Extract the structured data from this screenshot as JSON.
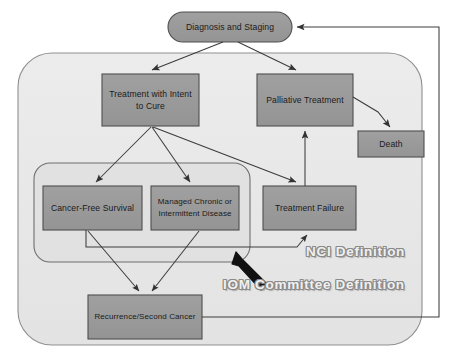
{
  "diagram": {
    "background_color": "#ffffff",
    "node_fill": "#999999",
    "node_stroke": "#555555",
    "container_fill": "#e8e8e8",
    "container_stroke": "#8a8a8a",
    "edge_color": "#404040",
    "text_color": "#1a1a1a"
  },
  "containers": [
    {
      "id": "nci-container",
      "name": "NCI Definition boundary",
      "label": "NCI Definition",
      "shape": "rounded-rectangle",
      "x": 18,
      "y": 53,
      "width": 404,
      "height": 292,
      "radius": 34
    },
    {
      "id": "iom-container",
      "name": "IOM Committee Definition boundary",
      "label": "IOM Committee Definition",
      "shape": "rounded-rectangle",
      "x": 34,
      "y": 163,
      "width": 216,
      "height": 99,
      "radius": 16
    }
  ],
  "nodes": [
    {
      "id": "diagnosis",
      "label": "Diagnosis and Staging",
      "shape": "stadium",
      "x": 168,
      "y": 12,
      "width": 124,
      "height": 30
    },
    {
      "id": "treatment-intent-cure",
      "label": "Treatment with Intent to Cure",
      "label_lines": [
        "Treatment with Intent",
        "to Cure"
      ],
      "shape": "rectangle",
      "x": 102,
      "y": 74,
      "width": 97,
      "height": 52
    },
    {
      "id": "palliative-treatment",
      "label": "Palliative Treatment",
      "label_lines": [
        "Palliative Treatment"
      ],
      "shape": "rectangle",
      "x": 257,
      "y": 74,
      "width": 96,
      "height": 52
    },
    {
      "id": "death",
      "label": "Death",
      "label_lines": [
        "Death"
      ],
      "shape": "rectangle",
      "x": 358,
      "y": 131,
      "width": 66,
      "height": 26
    },
    {
      "id": "cancer-free-survival",
      "label": "Cancer-Free Survival",
      "label_lines": [
        "Cancer-Free Survival"
      ],
      "shape": "rectangle",
      "x": 43,
      "y": 186,
      "width": 99,
      "height": 44
    },
    {
      "id": "managed-chronic",
      "label": "Managed Chronic or Intermittent Disease",
      "label_lines": [
        "Managed Chronic or",
        "Intermittent Disease"
      ],
      "shape": "rectangle",
      "x": 151,
      "y": 186,
      "width": 88,
      "height": 44
    },
    {
      "id": "treatment-failure",
      "label": "Treatment Failure",
      "label_lines": [
        "Treatment Failure"
      ],
      "shape": "rectangle",
      "x": 263,
      "y": 186,
      "width": 93,
      "height": 44
    },
    {
      "id": "recurrence-second-cancer",
      "label": "Recurrence/Second Cancer",
      "label_lines": [
        "Recurrence/Second Cancer"
      ],
      "shape": "rectangle",
      "x": 88,
      "y": 295,
      "width": 114,
      "height": 44
    }
  ],
  "edges": [
    {
      "id": "e1",
      "from": "diagnosis",
      "to": "treatment-intent-cure",
      "arrow": true
    },
    {
      "id": "e2",
      "from": "diagnosis",
      "to": "palliative-treatment",
      "arrow": true
    },
    {
      "id": "e3",
      "from": "treatment-intent-cure",
      "to": "cancer-free-survival",
      "arrow": true
    },
    {
      "id": "e4",
      "from": "treatment-intent-cure",
      "to": "managed-chronic",
      "arrow": true
    },
    {
      "id": "e5",
      "from": "treatment-intent-cure",
      "to": "treatment-failure",
      "arrow": true
    },
    {
      "id": "e6",
      "from": "palliative-treatment",
      "to": "death",
      "arrow": true
    },
    {
      "id": "e7",
      "from": "treatment-failure",
      "to": "palliative-treatment",
      "arrow": true
    },
    {
      "id": "e8",
      "from": "cancer-free-survival",
      "to": "treatment-failure",
      "arrow": true
    },
    {
      "id": "e9",
      "from": "cancer-free-survival",
      "to": "recurrence-second-cancer",
      "arrow": true
    },
    {
      "id": "e10",
      "from": "managed-chronic",
      "to": "recurrence-second-cancer",
      "arrow": true
    },
    {
      "id": "e11",
      "from": "recurrence-second-cancer",
      "to": "diagnosis",
      "arrow": true,
      "routing": "orthogonal-right"
    }
  ],
  "annotations": [
    {
      "id": "nci-label",
      "name": "NCI Definition label",
      "text": "NCI Definition",
      "style": "wordart-outline",
      "x": 306,
      "y": 244
    },
    {
      "id": "iom-label",
      "name": "IOM Committee Definition label",
      "text": "IOM Committee Definition",
      "style": "wordart-outline",
      "x": 223,
      "y": 277
    },
    {
      "id": "iom-pointer",
      "name": "IOM pointer arrow",
      "text": "",
      "style": "thick-black-arrow",
      "from_x": 264,
      "from_y": 283,
      "to_x": 236,
      "to_y": 256
    }
  ]
}
